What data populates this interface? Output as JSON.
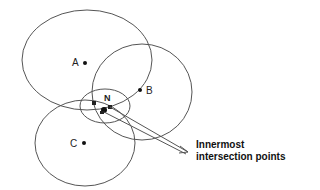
{
  "diagram": {
    "type": "ellipse-intersection",
    "circles": [
      {
        "label": "A",
        "cx": 87,
        "cy": 60,
        "rx": 65,
        "ry": 50,
        "dot": [
          85,
          63
        ]
      },
      {
        "label": "B",
        "cx": 142,
        "cy": 92,
        "rx": 50,
        "ry": 48,
        "dot": [
          140,
          90
        ]
      },
      {
        "label": "C",
        "cx": 85,
        "cy": 143,
        "rx": 50,
        "ry": 43,
        "dot": [
          84,
          143
        ]
      },
      {
        "label": "N",
        "cx": 105,
        "cy": 106,
        "rx": 25,
        "ry": 17,
        "dot": null
      }
    ],
    "intersection_points": [
      [
        94,
        103
      ],
      [
        104,
        110
      ],
      [
        110,
        107
      ],
      [
        102,
        112
      ]
    ],
    "annotation": {
      "line1": "Innermost",
      "line2": "intersection points"
    },
    "colors": {
      "stroke": "#555555",
      "dot": "#111111",
      "background": "#ffffff"
    }
  }
}
